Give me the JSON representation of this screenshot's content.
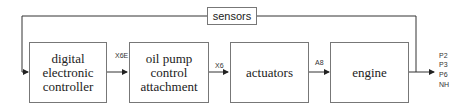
{
  "diagram": {
    "blocks": [
      {
        "id": "controller",
        "label": "digital electronic controller",
        "lines": [
          "digital",
          "electronic",
          "controller"
        ]
      },
      {
        "id": "pump",
        "label": "oil pump control attachment",
        "lines": [
          "oil pump",
          "control",
          "attachment"
        ]
      },
      {
        "id": "actuators",
        "label": "actuators",
        "lines": [
          "actuators"
        ]
      },
      {
        "id": "engine",
        "label": "engine",
        "lines": [
          "engine"
        ]
      },
      {
        "id": "sensors",
        "label": "sensors",
        "lines": [
          "sensors"
        ]
      }
    ],
    "edges": [
      {
        "from": "controller",
        "to": "pump",
        "label": "X6E"
      },
      {
        "from": "pump",
        "to": "actuators",
        "label": "X6"
      },
      {
        "from": "actuators",
        "to": "engine",
        "label": "A8"
      },
      {
        "from": "engine",
        "to": "outputs",
        "label": ""
      },
      {
        "from": "engine",
        "to": "sensors",
        "label": ""
      },
      {
        "from": "sensors",
        "to": "controller",
        "label": ""
      }
    ],
    "outputs": [
      "P2",
      "P3",
      "P6",
      "NH"
    ]
  }
}
